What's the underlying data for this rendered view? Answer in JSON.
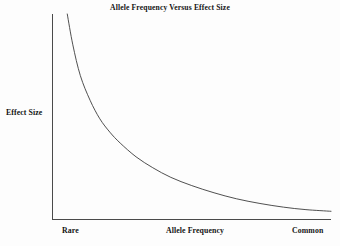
{
  "chart_data": {
    "type": "line",
    "title": "Allele Frequency Versus Effect Size",
    "xlabel": "Allele Frequency",
    "ylabel": "Effect Size",
    "xtick_labels": [
      "Rare",
      "Common"
    ],
    "ytick_labels": [],
    "grid": false,
    "legend": null,
    "axis_color": "#4a4a4a",
    "line_color": "#3c3c3c",
    "background_color": "#fdfdfd",
    "xlim": [
      0,
      1
    ],
    "ylim": [
      0,
      1
    ],
    "series": [
      {
        "name": "effect size",
        "description": "monotonically decreasing inverse-power curve: rare alleles have large effect size, common alleles have small effect size",
        "x": [
          0.053,
          0.073,
          0.1,
          0.135,
          0.17,
          0.206,
          0.243,
          0.3,
          0.36,
          0.425,
          0.5,
          0.58,
          0.66,
          0.745,
          0.83,
          0.91,
          1.0
        ],
        "y": [
          1.0,
          0.85,
          0.7,
          0.58,
          0.49,
          0.425,
          0.372,
          0.305,
          0.252,
          0.205,
          0.165,
          0.13,
          0.101,
          0.078,
          0.06,
          0.048,
          0.04
        ]
      }
    ]
  },
  "figure": {
    "title": "Allele Frequency Versus Effect Size",
    "ylabel": "Effect Size",
    "xlabel": "Allele Frequency",
    "tick_rare": "Rare",
    "tick_common": "Common"
  }
}
